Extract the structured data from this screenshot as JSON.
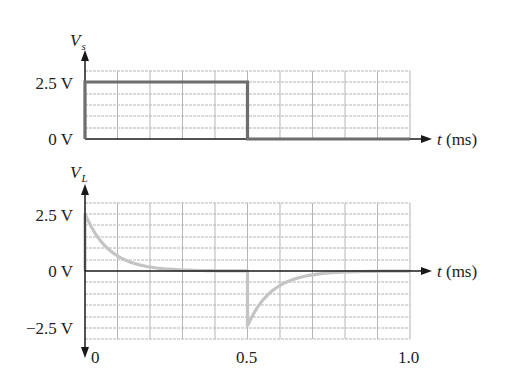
{
  "chart_data": [
    {
      "type": "line",
      "title": "",
      "ylabel": "V",
      "ylabel_sub": "s",
      "xlabel": "t (ms)",
      "x_var": "t",
      "x_unit": "(ms)",
      "ytick_labels": [
        "2.5 V",
        "0 V"
      ],
      "yticks": [
        2.5,
        0
      ],
      "ylim": [
        0,
        2.9
      ],
      "xlim": [
        0,
        1.0
      ],
      "grid": true,
      "series": [
        {
          "name": "Vs",
          "description": "Square pulse: 2.5 V from 0 to 0.5 ms, then 0 V",
          "x": [
            0,
            0,
            0.5,
            0.5,
            1.0
          ],
          "y": [
            0,
            2.5,
            2.5,
            0,
            0
          ]
        }
      ]
    },
    {
      "type": "line",
      "title": "",
      "ylabel": "V",
      "ylabel_sub": "L",
      "xlabel": "t (ms)",
      "x_var": "t",
      "x_unit": "(ms)",
      "ytick_labels": [
        "2.5 V",
        "0 V",
        "−2.5 V"
      ],
      "yticks": [
        2.5,
        0,
        -2.5
      ],
      "xtick_labels": [
        "0",
        "0.5",
        "1.0"
      ],
      "xticks": [
        0,
        0.5,
        1.0
      ],
      "ylim": [
        -2.5,
        2.9
      ],
      "xlim": [
        0,
        1.0
      ],
      "grid": true,
      "series": [
        {
          "name": "VL",
          "description": "Exponential decay from 2.5 V to ~0 V over 0-0.5 ms; at 0.5 ms drops to about -2.4 V then decays back to 0 V",
          "x": [
            0,
            0,
            0.05,
            0.1,
            0.15,
            0.2,
            0.25,
            0.3,
            0.4,
            0.5,
            0.5,
            0.55,
            0.6,
            0.65,
            0.7,
            0.75,
            0.8,
            0.9,
            1.0
          ],
          "y": [
            0,
            2.5,
            1.65,
            1.05,
            0.65,
            0.4,
            0.25,
            0.15,
            0.06,
            0.03,
            -2.4,
            -1.5,
            -0.95,
            -0.6,
            -0.35,
            -0.2,
            -0.1,
            -0.03,
            0
          ]
        }
      ]
    }
  ],
  "labels": {
    "top_ylabel": "V",
    "top_ylabel_sub": "s",
    "bottom_ylabel": "V",
    "bottom_ylabel_sub": "L",
    "top_ytick_2_5": "2.5 V",
    "top_ytick_0": "0 V",
    "bottom_ytick_2_5": "2.5 V",
    "bottom_ytick_0": "0 V",
    "bottom_ytick_neg": "−2.5 V",
    "xtick_0": "0",
    "xtick_05": "0.5",
    "xtick_10": "1.0",
    "t_var": "t",
    "t_unit": " (ms)"
  },
  "colors": {
    "vs_trace": "#6e6e6e",
    "vl_trace": "#c4c4c4",
    "grid": "#b5b5b5",
    "axis": "#1a1a1a"
  }
}
